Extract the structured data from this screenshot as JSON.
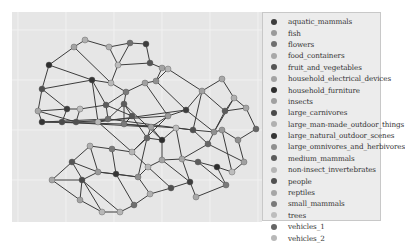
{
  "figure": {
    "type": "network-graph",
    "background": "#e6e6e6",
    "gridline_color": "#f4f4f4",
    "edge_color": "#3c3c3c"
  },
  "legend": {
    "items": [
      {
        "label": "aquatic_mammals",
        "color": "#3d3d3d"
      },
      {
        "label": "fish",
        "color": "#9a9a9a"
      },
      {
        "label": "flowers",
        "color": "#6f6f6f"
      },
      {
        "label": "food_containers",
        "color": "#a8a8a8"
      },
      {
        "label": "fruit_and_vegetables",
        "color": "#555555"
      },
      {
        "label": "household_electrical_devices",
        "color": "#a3a3a3"
      },
      {
        "label": "household_furniture",
        "color": "#2e2e2e"
      },
      {
        "label": "insects",
        "color": "#a0a0a0"
      },
      {
        "label": "large_carnivores",
        "color": "#4a4a4a"
      },
      {
        "label": "large_man-made_outdoor_things",
        "color": "#b0b0b0"
      },
      {
        "label": "large_natural_outdoor_scenes",
        "color": "#353535"
      },
      {
        "label": "large_omnivores_and_herbivores",
        "color": "#8f8f8f"
      },
      {
        "label": "medium_mammals",
        "color": "#5c5c5c"
      },
      {
        "label": "non-insect_invertebrates",
        "color": "#b5b5b5"
      },
      {
        "label": "people",
        "color": "#505050"
      },
      {
        "label": "reptiles",
        "color": "#a6a6a6"
      },
      {
        "label": "small_mammals",
        "color": "#7a7a7a"
      },
      {
        "label": "trees",
        "color": "#bdbdbd"
      },
      {
        "label": "vehicles_1",
        "color": "#666666"
      },
      {
        "label": "vehicles_2",
        "color": "#b8b8b8"
      }
    ]
  },
  "graph": {
    "nodes": [
      [
        73,
        28,
        9
      ],
      [
        62,
        35,
        5
      ],
      [
        97,
        35,
        9
      ],
      [
        118,
        31,
        2
      ],
      [
        134,
        32,
        0
      ],
      [
        37,
        53,
        6
      ],
      [
        106,
        53,
        17
      ],
      [
        138,
        51,
        4
      ],
      [
        30,
        77,
        14
      ],
      [
        99,
        71,
        19
      ],
      [
        150,
        56,
        5
      ],
      [
        156,
        57,
        13
      ],
      [
        80,
        68,
        10
      ],
      [
        114,
        80,
        16
      ],
      [
        144,
        69,
        11
      ],
      [
        133,
        71,
        7
      ],
      [
        94,
        93,
        12
      ],
      [
        26,
        99,
        3
      ],
      [
        55,
        97,
        0
      ],
      [
        68,
        97,
        17
      ],
      [
        120,
        104,
        4
      ],
      [
        112,
        92,
        12
      ],
      [
        30,
        110,
        10
      ],
      [
        50,
        110,
        8
      ],
      [
        64,
        110,
        14
      ],
      [
        86,
        110,
        19
      ],
      [
        96,
        107,
        2
      ],
      [
        112,
        112,
        16
      ],
      [
        139,
        115,
        5
      ],
      [
        156,
        104,
        1
      ],
      [
        174,
        98,
        0
      ],
      [
        190,
        79,
        7
      ],
      [
        210,
        67,
        3
      ],
      [
        222,
        86,
        9
      ],
      [
        213,
        99,
        12
      ],
      [
        234,
        96,
        15
      ],
      [
        202,
        120,
        11
      ],
      [
        181,
        118,
        14
      ],
      [
        164,
        116,
        17
      ],
      [
        150,
        128,
        6
      ],
      [
        135,
        126,
        18
      ],
      [
        120,
        140,
        13
      ],
      [
        100,
        137,
        16
      ],
      [
        78,
        134,
        9
      ],
      [
        60,
        150,
        4
      ],
      [
        40,
        168,
        15
      ],
      [
        70,
        168,
        8
      ],
      [
        86,
        160,
        1
      ],
      [
        104,
        162,
        10
      ],
      [
        126,
        165,
        11
      ],
      [
        136,
        155,
        19
      ],
      [
        150,
        148,
        5
      ],
      [
        170,
        147,
        3
      ],
      [
        186,
        150,
        12
      ],
      [
        205,
        155,
        6
      ],
      [
        220,
        160,
        17
      ],
      [
        232,
        150,
        7
      ],
      [
        196,
        132,
        18
      ],
      [
        178,
        170,
        0
      ],
      [
        159,
        176,
        14
      ],
      [
        138,
        182,
        9
      ],
      [
        122,
        193,
        2
      ],
      [
        108,
        200,
        13
      ],
      [
        90,
        200,
        19
      ],
      [
        68,
        188,
        5
      ],
      [
        214,
        173,
        16
      ],
      [
        184,
        185,
        3
      ],
      [
        210,
        118,
        1
      ],
      [
        226,
        128,
        11
      ],
      [
        244,
        117,
        18
      ]
    ],
    "edges": [
      [
        0,
        1
      ],
      [
        0,
        2
      ],
      [
        2,
        3
      ],
      [
        3,
        4
      ],
      [
        1,
        5
      ],
      [
        5,
        8
      ],
      [
        2,
        6
      ],
      [
        6,
        7
      ],
      [
        4,
        7
      ],
      [
        7,
        10
      ],
      [
        10,
        11
      ],
      [
        6,
        9
      ],
      [
        9,
        12
      ],
      [
        12,
        8
      ],
      [
        9,
        13
      ],
      [
        11,
        14
      ],
      [
        14,
        15
      ],
      [
        15,
        13
      ],
      [
        13,
        16
      ],
      [
        16,
        12
      ],
      [
        8,
        17
      ],
      [
        17,
        18
      ],
      [
        18,
        19
      ],
      [
        19,
        16
      ],
      [
        16,
        20
      ],
      [
        20,
        21
      ],
      [
        21,
        13
      ],
      [
        17,
        22
      ],
      [
        22,
        23
      ],
      [
        23,
        24
      ],
      [
        24,
        25
      ],
      [
        25,
        26
      ],
      [
        26,
        21
      ],
      [
        21,
        27
      ],
      [
        27,
        28
      ],
      [
        28,
        29
      ],
      [
        29,
        30
      ],
      [
        30,
        31
      ],
      [
        31,
        32
      ],
      [
        32,
        33
      ],
      [
        33,
        34
      ],
      [
        34,
        35
      ],
      [
        35,
        33
      ],
      [
        34,
        36
      ],
      [
        36,
        37
      ],
      [
        37,
        38
      ],
      [
        38,
        39
      ],
      [
        39,
        40
      ],
      [
        40,
        41
      ],
      [
        41,
        42
      ],
      [
        42,
        43
      ],
      [
        43,
        44
      ],
      [
        44,
        45
      ],
      [
        45,
        46
      ],
      [
        46,
        47
      ],
      [
        47,
        48
      ],
      [
        48,
        49
      ],
      [
        49,
        50
      ],
      [
        50,
        51
      ],
      [
        51,
        52
      ],
      [
        52,
        53
      ],
      [
        53,
        54
      ],
      [
        54,
        55
      ],
      [
        55,
        56
      ],
      [
        56,
        57
      ],
      [
        57,
        52
      ],
      [
        52,
        58
      ],
      [
        58,
        59
      ],
      [
        59,
        60
      ],
      [
        60,
        61
      ],
      [
        61,
        62
      ],
      [
        62,
        63
      ],
      [
        63,
        64
      ],
      [
        64,
        46
      ],
      [
        54,
        65
      ],
      [
        65,
        66
      ],
      [
        66,
        58
      ],
      [
        36,
        67
      ],
      [
        67,
        68
      ],
      [
        68,
        69
      ],
      [
        69,
        35
      ],
      [
        18,
        23
      ],
      [
        19,
        24
      ],
      [
        22,
        27
      ],
      [
        23,
        28
      ],
      [
        24,
        29
      ],
      [
        25,
        30
      ],
      [
        26,
        37
      ],
      [
        27,
        38
      ],
      [
        28,
        40
      ],
      [
        29,
        41
      ],
      [
        30,
        36
      ],
      [
        31,
        34
      ],
      [
        11,
        31
      ],
      [
        14,
        30
      ],
      [
        15,
        29
      ],
      [
        20,
        27
      ],
      [
        12,
        25
      ],
      [
        16,
        26
      ],
      [
        41,
        50
      ],
      [
        42,
        48
      ],
      [
        43,
        47
      ],
      [
        39,
        51
      ],
      [
        38,
        52
      ],
      [
        37,
        57
      ],
      [
        40,
        49
      ],
      [
        44,
        47
      ],
      [
        45,
        64
      ],
      [
        48,
        61
      ],
      [
        49,
        60
      ],
      [
        50,
        59
      ],
      [
        51,
        58
      ],
      [
        53,
        65
      ],
      [
        55,
        67
      ],
      [
        56,
        68
      ],
      [
        57,
        36
      ],
      [
        17,
        24
      ],
      [
        22,
        26
      ],
      [
        25,
        41
      ],
      [
        28,
        39
      ],
      [
        8,
        18
      ],
      [
        5,
        12
      ],
      [
        1,
        9
      ],
      [
        20,
        40
      ],
      [
        21,
        39
      ],
      [
        31,
        37
      ],
      [
        33,
        36
      ],
      [
        10,
        14
      ],
      [
        3,
        6
      ],
      [
        44,
        63
      ],
      [
        46,
        62
      ],
      [
        47,
        49
      ]
    ]
  }
}
